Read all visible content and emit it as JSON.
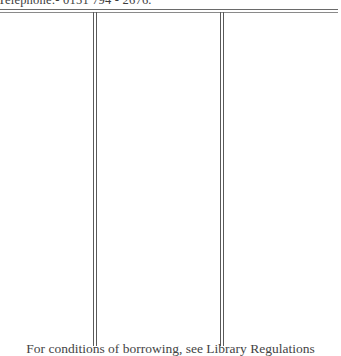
{
  "document": {
    "header_text": "Telephone:- 0151 794 - 2676.",
    "footer_text": "For conditions of borrowing, see Library Regulations"
  }
}
